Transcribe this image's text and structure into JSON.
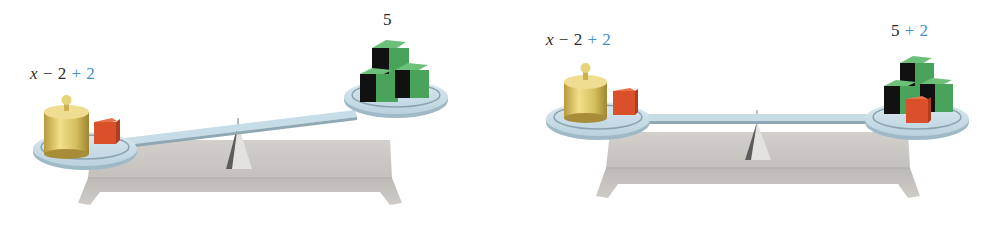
{
  "figure": {
    "colors": {
      "added_term": "#3f8fd0",
      "text": "#2a2a2a",
      "beam": "#c6dde8",
      "base": "#c9c6c2",
      "gold_weight": "#dcc766",
      "red_block": "#d9502a",
      "green_block": "#4aa35a"
    },
    "scales": [
      {
        "state": "unbalanced",
        "left_pan": {
          "label_var": "x",
          "label_minus": " − 2 ",
          "label_added": "+ 2",
          "items": [
            "gold-weight",
            "red-block"
          ]
        },
        "right_pan": {
          "label_value": "5",
          "label_added": "",
          "items": [
            "green-block",
            "green-block",
            "green-block"
          ]
        }
      },
      {
        "state": "balanced",
        "left_pan": {
          "label_var": "x",
          "label_minus": " − 2 ",
          "label_added": "+ 2",
          "items": [
            "gold-weight",
            "red-block"
          ]
        },
        "right_pan": {
          "label_value": "5 ",
          "label_added": "+ 2",
          "items": [
            "green-block",
            "green-block",
            "green-block",
            "red-block"
          ]
        }
      }
    ]
  }
}
